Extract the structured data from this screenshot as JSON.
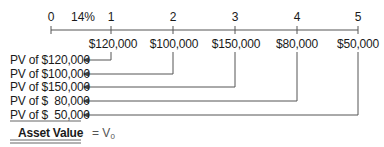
{
  "timeline": {
    "periods": [
      "0",
      "1",
      "2",
      "3",
      "4",
      "5"
    ],
    "rate_label": "14%",
    "cash_flows": [
      "$120,000",
      "$100,000",
      "$150,000",
      "$80,000",
      "$50,000"
    ]
  },
  "pv_rows": [
    {
      "label": "PV of $120,000"
    },
    {
      "label": "PV of $100,000"
    },
    {
      "label": "PV of $150,000"
    },
    {
      "label": "PV of $  80,000"
    },
    {
      "label": "PV of $  50,000"
    }
  ],
  "total": {
    "label": "Asset Value",
    "equals": "=",
    "symbol": "V",
    "subscript": "0"
  },
  "colors": {
    "line": "#444444",
    "text": "#1a1a1a"
  }
}
